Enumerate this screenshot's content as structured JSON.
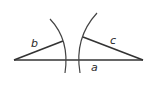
{
  "diagram": {
    "type": "geometry-construction",
    "colors": {
      "stroke": "#333333",
      "background": "#ffffff",
      "label": "#2a2a2a"
    },
    "segments": {
      "a": {
        "label": "a",
        "x1": 14,
        "y1": 60,
        "x2": 143,
        "y2": 60
      },
      "b": {
        "label": "b",
        "x1": 14,
        "y1": 60,
        "x2": 63,
        "y2": 41
      },
      "c": {
        "label": "c",
        "x1": 143,
        "y1": 60,
        "x2": 83,
        "y2": 37
      }
    },
    "arcs": {
      "left": {
        "path": "M 50 19 Q 70 40 65 73"
      },
      "right": {
        "path": "M 97 13 Q 74 38 80 73"
      }
    },
    "labels": {
      "a": {
        "text": "a",
        "x": 91,
        "y": 71
      },
      "b": {
        "text": "b",
        "x": 31,
        "y": 47
      },
      "c": {
        "text": "c",
        "x": 110,
        "y": 44
      }
    }
  }
}
